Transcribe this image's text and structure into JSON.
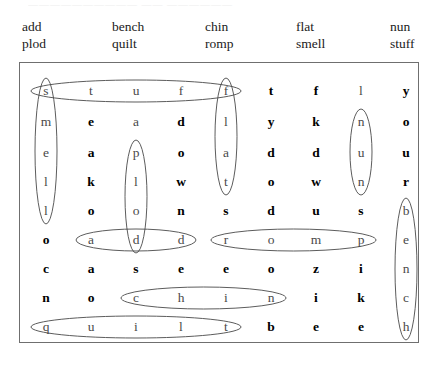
{
  "top_partial_text": "——————————  —— ——————",
  "wordlist": {
    "columns": [
      {
        "x": 22,
        "words": [
          "add",
          "plod"
        ]
      },
      {
        "x": 112,
        "words": [
          "bench",
          "quilt"
        ]
      },
      {
        "x": 205,
        "words": [
          "chin",
          "romp"
        ]
      },
      {
        "x": 296,
        "words": [
          "flat",
          "smell"
        ]
      },
      {
        "x": 390,
        "words": [
          "nun",
          "stuff"
        ]
      }
    ]
  },
  "grid": {
    "rows": 9,
    "cols": 9,
    "letters": [
      [
        "s",
        "t",
        "u",
        "f",
        "f",
        "t",
        "f",
        "l",
        "y"
      ],
      [
        "m",
        "e",
        "a",
        "d",
        "l",
        "y",
        "k",
        "n",
        "o"
      ],
      [
        "e",
        "a",
        "p",
        "o",
        "a",
        "d",
        "d",
        "u",
        "u"
      ],
      [
        "l",
        "k",
        "l",
        "w",
        "t",
        "o",
        "w",
        "n",
        "r"
      ],
      [
        "l",
        "o",
        "o",
        "n",
        "s",
        "d",
        "u",
        "s",
        "b"
      ],
      [
        "o",
        "a",
        "d",
        "d",
        "r",
        "o",
        "m",
        "p",
        "e"
      ],
      [
        "c",
        "a",
        "s",
        "e",
        "e",
        "o",
        "z",
        "i",
        "n"
      ],
      [
        "n",
        "o",
        "c",
        "h",
        "i",
        "n",
        "i",
        "k",
        "c"
      ],
      [
        "q",
        "u",
        "i",
        "l",
        "t",
        "b",
        "e",
        "e",
        "h"
      ]
    ],
    "marked": [
      [
        true,
        true,
        true,
        true,
        true,
        false,
        false,
        true,
        false
      ],
      [
        true,
        false,
        true,
        false,
        true,
        false,
        false,
        true,
        false
      ],
      [
        true,
        false,
        true,
        false,
        true,
        false,
        false,
        true,
        false
      ],
      [
        true,
        false,
        true,
        false,
        true,
        false,
        false,
        true,
        false
      ],
      [
        true,
        false,
        true,
        false,
        false,
        false,
        false,
        false,
        true
      ],
      [
        false,
        true,
        true,
        true,
        true,
        true,
        true,
        true,
        true
      ],
      [
        false,
        false,
        false,
        false,
        false,
        false,
        false,
        false,
        true
      ],
      [
        false,
        false,
        true,
        true,
        true,
        true,
        false,
        false,
        true
      ],
      [
        true,
        true,
        true,
        true,
        true,
        false,
        false,
        false,
        true
      ]
    ]
  },
  "solutions": [
    {
      "word": "stuff",
      "orientation": "horizontal",
      "row": 0,
      "col_start": 0,
      "col_end": 4
    },
    {
      "word": "smell",
      "orientation": "vertical",
      "col": 0,
      "row_start": 0,
      "row_end": 4
    },
    {
      "word": "flat",
      "orientation": "vertical",
      "col": 4,
      "row_start": 0,
      "row_end": 3
    },
    {
      "word": "nun",
      "orientation": "vertical",
      "col": 7,
      "row_start": 1,
      "row_end": 3
    },
    {
      "word": "plod",
      "orientation": "vertical",
      "col": 2,
      "row_start": 2,
      "row_end": 5
    },
    {
      "word": "add",
      "orientation": "horizontal",
      "row": 5,
      "col_start": 1,
      "col_end": 3
    },
    {
      "word": "romp",
      "orientation": "horizontal",
      "row": 5,
      "col_start": 4,
      "col_end": 7
    },
    {
      "word": "bench",
      "orientation": "vertical",
      "col": 8,
      "row_start": 4,
      "row_end": 8
    },
    {
      "word": "chin",
      "orientation": "horizontal",
      "row": 7,
      "col_start": 2,
      "col_end": 5
    },
    {
      "word": "quilt",
      "orientation": "horizontal",
      "row": 8,
      "col_start": 0,
      "col_end": 4
    }
  ],
  "style": {
    "ellipse_stroke": "#4a4a4a",
    "box_border": "#6f6f6f"
  }
}
